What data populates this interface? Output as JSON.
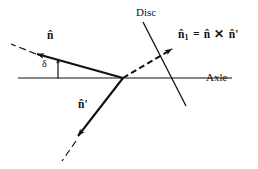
{
  "figure": {
    "type": "vector-diagram",
    "background_color": "#ffffff",
    "stroke_color": "#111111",
    "width": 258,
    "height": 169
  },
  "labels": {
    "disc": "Disc",
    "axle": "Axle",
    "n_hat": "n̂",
    "n_hat_prime": "n̂'",
    "delta": "δ"
  },
  "equation": {
    "lhs": "n̂",
    "lhs_subscript": "1",
    "equals": "=",
    "operand_a": "n̂",
    "operator": "✕",
    "operand_b": "n̂'",
    "full_text": "n̂₁ = n̂ ✕ n̂'"
  },
  "geometry": {
    "origin": {
      "x": 123,
      "y": 78
    },
    "axle_line": {
      "x1": 18,
      "y1": 78,
      "x2": 232,
      "y2": 78
    },
    "disc_line": {
      "x1": 143,
      "y1": 22,
      "x2": 186,
      "y2": 106
    },
    "n_hat_vector": {
      "x1": 123,
      "y1": 78,
      "x2": 34,
      "y2": 53,
      "style": "solid-arrow"
    },
    "n_hat_dashed_tail": {
      "x1": 34,
      "y1": 53,
      "x2": 11,
      "y2": 44,
      "style": "dashed"
    },
    "n_hat_prime_vector": {
      "x1": 123,
      "y1": 78,
      "x2": 75,
      "y2": 140,
      "style": "solid-arrow"
    },
    "n_hat_prime_dashed_tail": {
      "x1": 75,
      "y1": 140,
      "x2": 62,
      "y2": 161,
      "style": "dashed"
    },
    "n_hat_1_vector": {
      "x1": 123,
      "y1": 78,
      "x2": 176,
      "y2": 47,
      "style": "dashed-arrow"
    },
    "delta_marker": {
      "x": 58,
      "y1": 78,
      "y2": 57,
      "style": "double-arrow"
    },
    "delta_angle_degrees": 16
  }
}
